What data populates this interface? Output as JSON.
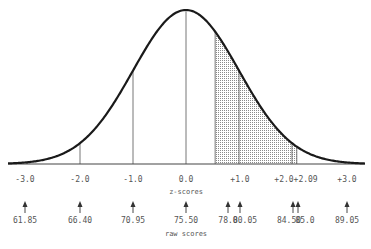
{
  "colors": {
    "curve": "#1a1a1a",
    "axis": "#444444",
    "lines": "#666666",
    "shade": "#bbbbbb",
    "text": "#555555"
  },
  "geometry": {
    "mean_x": 186,
    "sigma_px": 53,
    "baseline_y": 164,
    "peak_y": 10,
    "axis_x0": 8,
    "axis_x1": 365
  },
  "captions": {
    "z_axis": "z-scores",
    "raw_axis": "raw scores"
  },
  "z_labels": [
    {
      "text": "-3.0",
      "x": 25
    },
    {
      "text": "-2.0",
      "x": 80
    },
    {
      "text": "-1.0",
      "x": 133
    },
    {
      "text": "0.0",
      "x": 186
    },
    {
      "text": "+1.0",
      "x": 240
    },
    {
      "text": "+2.0+2.09",
      "x": 296
    },
    {
      "text": "+3.0",
      "x": 347
    }
  ],
  "raw_labels": [
    {
      "text": "61.85",
      "x": 25
    },
    {
      "text": "66.40",
      "x": 80
    },
    {
      "text": "70.95",
      "x": 133
    },
    {
      "text": "75.50",
      "x": 186
    },
    {
      "text": "78.0",
      "x": 228
    },
    {
      "text": "80.05",
      "x": 245
    },
    {
      "text": "84.50",
      "x": 289
    },
    {
      "text": "85.0",
      "x": 305
    },
    {
      "text": "89.05",
      "x": 347
    }
  ],
  "arrows_x": [
    25,
    80,
    133,
    186,
    228,
    240,
    293,
    298,
    347
  ],
  "shaded_region": {
    "z_from": 0.55,
    "z_to": 2.09,
    "raw_from": "78.0",
    "raw_to": "85.0"
  },
  "vertical_lines_z": [
    -3,
    -2,
    -1,
    0,
    0.55,
    1,
    2,
    2.09,
    3
  ]
}
